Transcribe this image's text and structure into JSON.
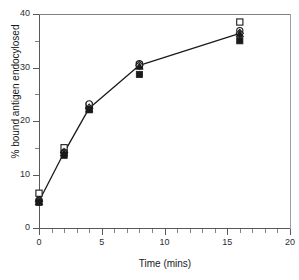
{
  "chart_data": {
    "type": "line",
    "title": "",
    "xlabel": "Time (mins)",
    "ylabel": "% bound antigen endocylosed",
    "xlim": [
      0,
      20
    ],
    "ylim": [
      0,
      40
    ],
    "xticks": [
      0,
      5,
      10,
      15,
      20
    ],
    "yticks": [
      0,
      10,
      20,
      30,
      40
    ],
    "xtick_labels": [
      "0",
      "5",
      "10",
      "15",
      "20"
    ],
    "ytick_labels": [
      "0",
      "10",
      "20",
      "30",
      "40"
    ],
    "x_minor_ticks": [
      1,
      2,
      3,
      4,
      6,
      7,
      8,
      9,
      11,
      12,
      13,
      14,
      16,
      17,
      18,
      19
    ],
    "y_minor_ticks": [
      5,
      15,
      25,
      35
    ],
    "grid": false,
    "legend": "none",
    "x": [
      0,
      2,
      4,
      8,
      16
    ],
    "series": [
      {
        "name": "open square",
        "marker": "open-square",
        "values": [
          6.5,
          15.0,
          22.8,
          30.4,
          38.5
        ],
        "connected": false
      },
      {
        "name": "open circle",
        "marker": "open-circle",
        "values": [
          5.2,
          14.2,
          23.2,
          30.7,
          36.9
        ],
        "connected": false
      },
      {
        "name": "open diamond",
        "marker": "open-diamond",
        "values": [
          5.0,
          14.1,
          22.4,
          30.4,
          36.4
        ],
        "connected": true
      },
      {
        "name": "filled triangle",
        "marker": "filled-triangle",
        "values": [
          4.9,
          14.0,
          22.2,
          30.2,
          36.3
        ],
        "connected": false
      },
      {
        "name": "filled square",
        "marker": "filled-square",
        "values": [
          4.8,
          13.6,
          22.1,
          28.7,
          35.0
        ],
        "connected": false
      }
    ],
    "line_color": "#1a1a1a",
    "marker_color": "#1a1a1a",
    "axis_color": "#555a5e"
  }
}
